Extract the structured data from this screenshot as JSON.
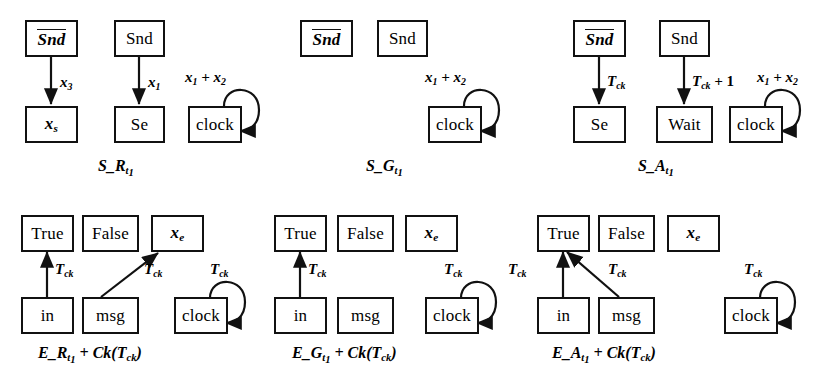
{
  "figure": {
    "background_color": "#ffffff",
    "stroke_color": "#111111"
  },
  "panels": [
    {
      "id": "S_R",
      "caption": "S_R t1",
      "caption_parts": {
        "main": "S_R",
        "sub": "t",
        "subsub": "1"
      },
      "nodes": [
        {
          "name": "snd-bar",
          "label": "Snd",
          "overline": true,
          "italic": true
        },
        {
          "name": "x-s",
          "label": "x",
          "sub": "s",
          "italic": true
        },
        {
          "name": "snd",
          "label": "Snd",
          "overline": false,
          "italic": false
        },
        {
          "name": "se",
          "label": "Se",
          "italic": false
        },
        {
          "name": "clock",
          "label": "clock",
          "italic": false
        }
      ],
      "edges": [
        {
          "from": "snd-bar",
          "to": "x-s",
          "label": "x3"
        },
        {
          "from": "snd",
          "to": "se",
          "label": "x1"
        },
        {
          "from": "clock",
          "to": "clock",
          "label": "x1 + x2",
          "self_loop": true
        }
      ]
    },
    {
      "id": "S_G",
      "caption": "S_G t1",
      "caption_parts": {
        "main": "S_G",
        "sub": "t",
        "subsub": "1"
      },
      "nodes": [
        {
          "name": "snd-bar",
          "label": "Snd",
          "overline": true,
          "italic": true
        },
        {
          "name": "snd",
          "label": "Snd",
          "overline": false,
          "italic": false
        },
        {
          "name": "clock",
          "label": "clock",
          "italic": false
        }
      ],
      "edges": [
        {
          "from": "clock",
          "to": "clock",
          "label": "x1 + x2",
          "self_loop": true
        }
      ]
    },
    {
      "id": "S_A",
      "caption": "S_A t1",
      "caption_parts": {
        "main": "S_A",
        "sub": "t",
        "subsub": "1"
      },
      "nodes": [
        {
          "name": "snd-bar",
          "label": "Snd",
          "overline": true,
          "italic": true
        },
        {
          "name": "se",
          "label": "Se",
          "italic": false
        },
        {
          "name": "snd",
          "label": "Snd",
          "overline": false,
          "italic": false
        },
        {
          "name": "wait",
          "label": "Wait",
          "italic": false
        },
        {
          "name": "clock",
          "label": "clock",
          "italic": false
        }
      ],
      "edges": [
        {
          "from": "snd-bar",
          "to": "se",
          "label": "Tck"
        },
        {
          "from": "snd",
          "to": "wait",
          "label": "Tck + 1"
        },
        {
          "from": "clock",
          "to": "clock",
          "label": "x1 + x2",
          "self_loop": true
        }
      ]
    },
    {
      "id": "E_R",
      "caption": "E_R t1 + Ck(Tck)",
      "caption_parts": {
        "main": "E_R",
        "sub": "t",
        "subsub": "1",
        "tail": " + Ck(T",
        "tailsub": "ck",
        "tailend": ")"
      },
      "nodes": [
        {
          "name": "true",
          "label": "True",
          "italic": false
        },
        {
          "name": "false",
          "label": "False",
          "italic": false
        },
        {
          "name": "x-e",
          "label": "x",
          "sub": "e",
          "italic": true
        },
        {
          "name": "in",
          "label": "in",
          "italic": false
        },
        {
          "name": "msg",
          "label": "msg",
          "italic": false
        },
        {
          "name": "clock",
          "label": "clock",
          "italic": false
        }
      ],
      "edges": [
        {
          "from": "in",
          "to": "true",
          "label": "Tck"
        },
        {
          "from": "msg",
          "to": "x-e",
          "label": "Tck"
        },
        {
          "from": "clock",
          "to": "clock",
          "label": "Tck",
          "self_loop": true
        }
      ]
    },
    {
      "id": "E_G",
      "caption": "E_G t1 + Ck(Tck)",
      "caption_parts": {
        "main": "E_G",
        "sub": "t",
        "subsub": "1",
        "tail": " + Ck(T",
        "tailsub": "ck",
        "tailend": ")"
      },
      "nodes": [
        {
          "name": "true",
          "label": "True",
          "italic": false
        },
        {
          "name": "false",
          "label": "False",
          "italic": false
        },
        {
          "name": "x-e",
          "label": "x",
          "sub": "e",
          "italic": true
        },
        {
          "name": "in",
          "label": "in",
          "italic": false
        },
        {
          "name": "msg",
          "label": "msg",
          "italic": false
        },
        {
          "name": "clock",
          "label": "clock",
          "italic": false
        }
      ],
      "edges": [
        {
          "from": "in",
          "to": "true",
          "label": "Tck"
        },
        {
          "from": "clock",
          "to": "clock",
          "label": "Tck",
          "self_loop": true
        }
      ]
    },
    {
      "id": "E_A",
      "caption": "E_A t1 + Ck(Tck)",
      "caption_parts": {
        "main": "E_A",
        "sub": "t",
        "subsub": "1",
        "tail": " + Ck(T",
        "tailsub": "ck",
        "tailend": ")"
      },
      "nodes": [
        {
          "name": "true",
          "label": "True",
          "italic": false
        },
        {
          "name": "false",
          "label": "False",
          "italic": false
        },
        {
          "name": "x-e",
          "label": "x",
          "sub": "e",
          "italic": true
        },
        {
          "name": "in",
          "label": "in",
          "italic": false
        },
        {
          "name": "msg",
          "label": "msg",
          "italic": false
        },
        {
          "name": "clock",
          "label": "clock",
          "italic": false
        }
      ],
      "edges": [
        {
          "from": "in",
          "to": "true",
          "label": "Tck"
        },
        {
          "from": "msg",
          "to": "true",
          "label": "Tck"
        },
        {
          "from": "clock",
          "to": "clock",
          "label": "Tck",
          "self_loop": true
        }
      ]
    }
  ],
  "text": {
    "snd": "Snd",
    "snd_bar": "Snd",
    "se": "Se",
    "wait": "Wait",
    "clock": "clock",
    "true": "True",
    "false": "False",
    "in": "in",
    "msg": "msg",
    "x_var": "x",
    "sub_s": "s",
    "sub_e": "e",
    "sub_3": "3",
    "sub_1": "1",
    "sub_2": "2",
    "sub_ck": "ck",
    "sub_t": "t",
    "T": "T",
    "plus": "+",
    "one": "1",
    "x1_plus_x2_pre": "x",
    "cap_SR": "S",
    "cap_SG": "S",
    "cap_SA": "S",
    "cap_ER": "E",
    "cap_EG": "E",
    "cap_EA": "E",
    "us_R": "_R",
    "us_G": "_G",
    "us_A": "_A",
    "ck_tail": " + Ck(T",
    "paren_close": ")"
  }
}
